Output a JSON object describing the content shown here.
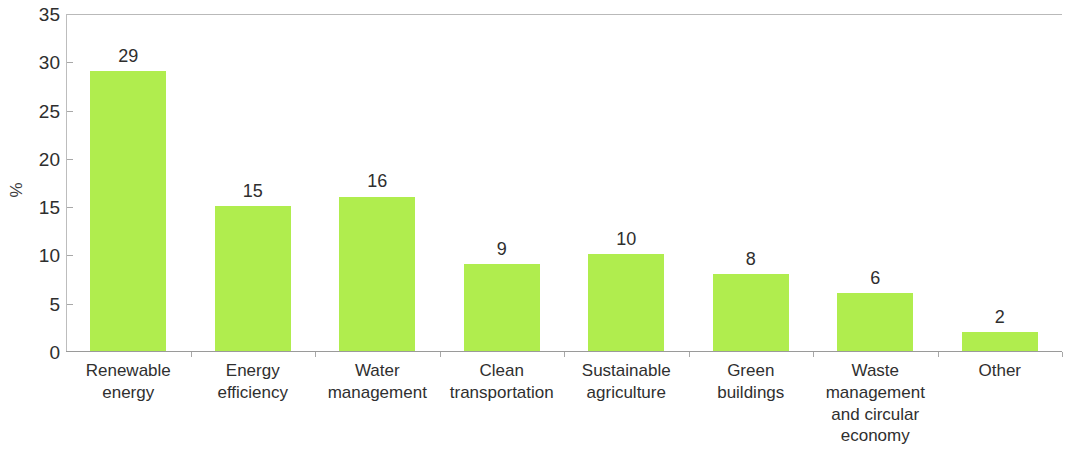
{
  "chart_data": {
    "type": "bar",
    "title": "",
    "xlabel": "",
    "ylabel": "%",
    "ylim": [
      0,
      35
    ],
    "ytick_values": [
      0,
      5,
      10,
      15,
      20,
      25,
      30,
      35
    ],
    "ytick_labels": [
      "0",
      "5",
      "10",
      "15",
      "20",
      "25",
      "30",
      "35"
    ],
    "grid": false,
    "legend": null,
    "bar_color": "#b0ed4e",
    "categories": [
      "Renewable\nenergy",
      "Energy\nefficiency",
      "Water\nmanagement",
      "Clean\ntransportation",
      "Sustainable\nagriculture",
      "Green\nbuildings",
      "Waste\nmanagement\nand circular\neconomy",
      "Other"
    ],
    "values": [
      29,
      15,
      16,
      9,
      10,
      8,
      6,
      2
    ],
    "value_labels": [
      "29",
      "15",
      "16",
      "9",
      "10",
      "8",
      "6",
      "2"
    ]
  }
}
